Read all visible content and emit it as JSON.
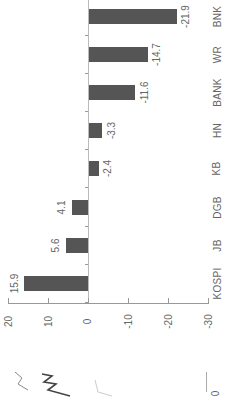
{
  "chart_data": {
    "type": "bar",
    "orientation": "horizontal-rotated",
    "title": "",
    "xlabel": "",
    "ylabel": "",
    "categories": [
      "KOSPI",
      "JB",
      "DGB",
      "KB",
      "HN",
      "BANK",
      "WR",
      "BNK"
    ],
    "values": [
      15.9,
      5.6,
      4.1,
      -2.4,
      -3.3,
      -11.6,
      -14.7,
      -21.9
    ],
    "value_labels": [
      "15.9",
      "5.6",
      "4.1",
      "-2.4",
      "-3.3",
      "-11.6",
      "-14.7",
      "-21.9"
    ],
    "value_axis": {
      "range": [
        -30,
        20
      ],
      "ticks": [
        "20",
        "10",
        "0",
        "-10",
        "-20",
        "-30"
      ]
    },
    "grid": false,
    "legend": null,
    "bar_color": "#555555"
  },
  "fragments": {
    "left_partial_axis_label": "0"
  }
}
